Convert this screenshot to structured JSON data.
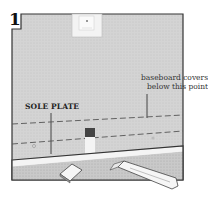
{
  "figure": {
    "step_number": "1",
    "labels": {
      "baseboard_line1": "baseboard covers",
      "baseboard_line2": "below this point",
      "sole_plate": "SOLE PLATE"
    },
    "colors": {
      "wall": "#d6d6d6",
      "floor": "#c8c8c8",
      "outline": "#3a3a3a",
      "sole_plate": "#f4f4f4",
      "outlet": "#efefef"
    }
  }
}
